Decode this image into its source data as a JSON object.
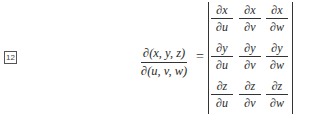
{
  "equation": {
    "number": "12",
    "lhs": {
      "numerator": "∂(x, y, z)",
      "denominator": "∂(u, v, w)"
    },
    "relation": "=",
    "determinant": {
      "rows": [
        [
          {
            "numerator": "∂x",
            "denominator": "∂u"
          },
          {
            "numerator": "∂x",
            "denominator": "∂v"
          },
          {
            "numerator": "∂x",
            "denominator": "∂w"
          }
        ],
        [
          {
            "numerator": "∂y",
            "denominator": "∂u"
          },
          {
            "numerator": "∂y",
            "denominator": "∂v"
          },
          {
            "numerator": "∂y",
            "denominator": "∂w"
          }
        ],
        [
          {
            "numerator": "∂z",
            "denominator": "∂u"
          },
          {
            "numerator": "∂z",
            "denominator": "∂v"
          },
          {
            "numerator": "∂z",
            "denominator": "∂w"
          }
        ]
      ]
    }
  }
}
